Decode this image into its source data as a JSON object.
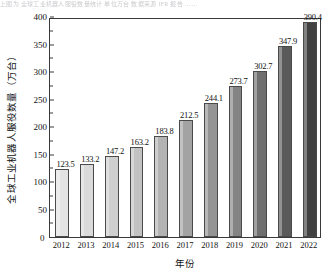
{
  "bleed_text": "上图为 全球工业机器人服役数量统计 单位万台 数据来源 IFR 报告 ……",
  "chart_data": {
    "type": "bar",
    "title": "",
    "xlabel": "年份",
    "ylabel": "全球工业机器人服役数量（万台）",
    "categories": [
      "2012",
      "2013",
      "2014",
      "2015",
      "2016",
      "2017",
      "2018",
      "2019",
      "2020",
      "2021",
      "2022"
    ],
    "values": [
      123.5,
      133.2,
      147.2,
      163.2,
      183.8,
      212.5,
      244.1,
      273.7,
      302.7,
      347.9,
      390.4
    ],
    "value_labels": [
      "123.5",
      "133.2",
      "147.2",
      "163.2",
      "183.8",
      "212.5",
      "244.1",
      "273.7",
      "302.7",
      "347.9",
      "390.4"
    ],
    "ylim": [
      0,
      400
    ],
    "ytick_labels": [
      "0",
      "50",
      "100",
      "150",
      "200",
      "250",
      "300",
      "350",
      "400"
    ],
    "ytick_values": [
      0,
      50,
      100,
      150,
      200,
      250,
      300,
      350,
      400
    ],
    "yminor_values": [
      25,
      75,
      125,
      175,
      225,
      275,
      325,
      375
    ],
    "grid": false,
    "legend": "none",
    "zero_label": "0",
    "bar_colors": [
      "#e3e3e3",
      "#dadada",
      "#cfcfcf",
      "#c2c2c2",
      "#b3b3b3",
      "#a3a3a3",
      "#949494",
      "#848484",
      "#6f6f6f",
      "#5a5a5a",
      "#414141"
    ],
    "axis_color": "#3a3a3a"
  }
}
